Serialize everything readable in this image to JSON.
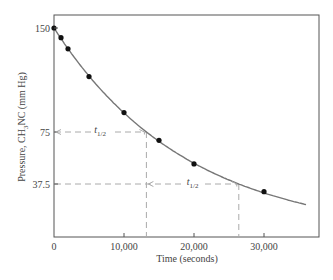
{
  "chart_data": {
    "type": "line",
    "title": "",
    "xlabel": "Time (seconds)",
    "ylabel": "Pressure, CH3NC (mm Hg)",
    "ylabel_parts": {
      "pre": "Pressure, CH",
      "sub": "3",
      "post": "NC (mm Hg)"
    },
    "xlim": [
      0,
      37000
    ],
    "ylim": [
      0,
      160
    ],
    "x_ticks": [
      0,
      10000,
      20000,
      30000
    ],
    "x_tick_labels": [
      "0",
      "10,000",
      "20,000",
      "30,000"
    ],
    "y_ticks": [
      150,
      75,
      37.5
    ],
    "y_tick_labels": [
      "150",
      "75",
      "37.5"
    ],
    "grid": false,
    "legend": null,
    "series": [
      {
        "name": "CH3NC pressure (data points)",
        "x": [
          0,
          1000,
          2000,
          5000,
          10000,
          15000,
          20000,
          30000
        ],
        "y": [
          150,
          143,
          135,
          115,
          89,
          69,
          52,
          32
        ]
      },
      {
        "name": "first-order decay fit",
        "model": "P = 150 * exp(-k t)",
        "k": 5.25e-05,
        "x_range": [
          0,
          36000
        ]
      }
    ],
    "annotations": [
      {
        "type": "half-life",
        "label": "t1/2",
        "label_main": "t",
        "label_sub": "1/2",
        "from_x": 0,
        "to_x": 13200,
        "y": 75
      },
      {
        "type": "half-life",
        "label": "t1/2",
        "label_main": "t",
        "label_sub": "1/2",
        "from_x": 13200,
        "to_x": 26400,
        "y": 37.5
      }
    ],
    "guides": [
      {
        "type": "horizontal-dashed",
        "y": 75,
        "to_x": 13200
      },
      {
        "type": "vertical-dashed",
        "x": 13200,
        "from_y": 75,
        "to_y": 0
      },
      {
        "type": "horizontal-dashed",
        "y": 37.5,
        "to_x": 26400
      },
      {
        "type": "vertical-dashed",
        "x": 26400,
        "from_y": 37.5,
        "to_y": 0
      }
    ]
  },
  "colors": {
    "frame": "#555555",
    "curve": "#777777",
    "points": "#111111",
    "dashes": "#aaaaaa"
  }
}
